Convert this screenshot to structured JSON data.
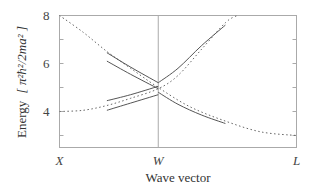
{
  "chart_data": {
    "type": "line",
    "title": "",
    "xlabel": "Wave vector",
    "ylabel": "Energy [ π²ħ²/2ma² ]",
    "ylabel_parts": {
      "word": "Energy",
      "unit": "[ π²ħ²/2ma² ]"
    },
    "x_ticks": [
      {
        "label": "X",
        "pos": 0.0
      },
      {
        "label": "W",
        "pos": 0.4167
      },
      {
        "label": "L",
        "pos": 1.0
      }
    ],
    "y_ticks": [
      4,
      6,
      8
    ],
    "y_minor_ticks": [
      3,
      5,
      7
    ],
    "ylim": [
      2.5,
      8
    ],
    "xlim": [
      0,
      1
    ],
    "grid": false,
    "legend": null,
    "series": [
      {
        "name": "free-electron band 1 (dotted)",
        "style": "dotted",
        "points": [
          [
            0.0,
            8.0
          ],
          [
            0.1,
            7.3
          ],
          [
            0.2,
            6.5
          ],
          [
            0.3,
            5.8
          ],
          [
            0.4167,
            5.0
          ],
          [
            0.55,
            4.2
          ],
          [
            0.7,
            3.6
          ],
          [
            0.85,
            3.15
          ],
          [
            1.0,
            3.0
          ]
        ]
      },
      {
        "name": "free-electron band 2 (dotted)",
        "style": "dotted",
        "points": [
          [
            0.0,
            4.0
          ],
          [
            0.1,
            4.05
          ],
          [
            0.2,
            4.25
          ],
          [
            0.3,
            4.55
          ],
          [
            0.4167,
            4.95
          ],
          [
            0.5,
            5.5
          ],
          [
            0.6,
            6.6
          ],
          [
            0.7,
            7.7
          ],
          [
            0.75,
            8.0
          ]
        ]
      },
      {
        "name": "upper-left band (solid, outer)",
        "style": "solid",
        "points": [
          [
            0.2,
            6.45
          ],
          [
            0.3,
            5.85
          ],
          [
            0.4167,
            5.2
          ]
        ]
      },
      {
        "name": "upper-left band (solid, inner)",
        "style": "solid",
        "points": [
          [
            0.2,
            6.1
          ],
          [
            0.3,
            5.55
          ],
          [
            0.4167,
            4.95
          ]
        ]
      },
      {
        "name": "lower-left band (solid, outer)",
        "style": "solid",
        "points": [
          [
            0.2,
            4.45
          ],
          [
            0.3,
            4.7
          ],
          [
            0.4167,
            5.05
          ]
        ]
      },
      {
        "name": "lower-left band (solid, inner)",
        "style": "solid",
        "points": [
          [
            0.2,
            4.05
          ],
          [
            0.3,
            4.35
          ],
          [
            0.4167,
            4.7
          ]
        ]
      },
      {
        "name": "upper-right band (solid)",
        "style": "solid",
        "points": [
          [
            0.4167,
            5.2
          ],
          [
            0.5,
            5.8
          ],
          [
            0.6,
            6.75
          ],
          [
            0.7,
            7.6
          ]
        ]
      },
      {
        "name": "lower-right band (solid)",
        "style": "solid",
        "points": [
          [
            0.4167,
            4.8
          ],
          [
            0.5,
            4.3
          ],
          [
            0.6,
            3.85
          ],
          [
            0.7,
            3.5
          ]
        ]
      }
    ]
  }
}
